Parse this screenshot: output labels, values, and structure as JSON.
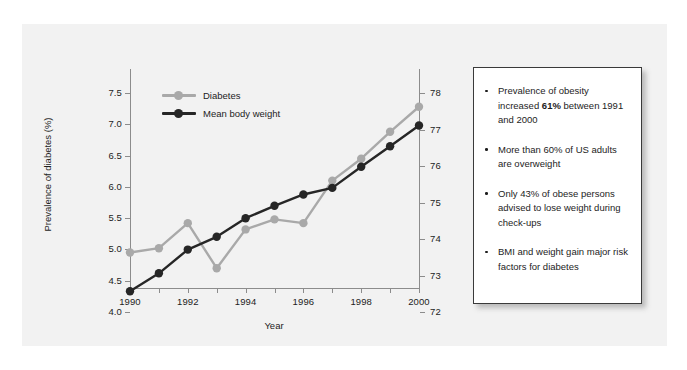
{
  "chart_data": {
    "type": "line",
    "title": "",
    "xlabel": "Year",
    "ylabel": "Prevalence of diabetes (%)",
    "y2label": "Mean body weight (kg)",
    "grid": false,
    "legend_position": "top-left inside plot",
    "x": [
      1990,
      1991,
      1992,
      1993,
      1994,
      1995,
      1996,
      1997,
      1998,
      1999,
      2000
    ],
    "xlim": [
      1990,
      2000
    ],
    "xticklabels": [
      "1990",
      "1992",
      "1994",
      "1996",
      "1998",
      "2000"
    ],
    "ylim": [
      4.0,
      7.5
    ],
    "yticklabels": [
      "4.0",
      "4.5",
      "5.0",
      "5.5",
      "6.0",
      "6.5",
      "7.0",
      "7.5"
    ],
    "y2lim": [
      72,
      78
    ],
    "y2ticklabels": [
      "72",
      "73",
      "74",
      "75",
      "76",
      "77",
      "78"
    ],
    "series": [
      {
        "name": "Diabetes",
        "axis": "left",
        "units": "%",
        "color": "#a9a9a9",
        "values": [
          4.95,
          5.02,
          5.42,
          4.7,
          5.32,
          5.48,
          5.42,
          6.1,
          6.45,
          6.88,
          7.28
        ]
      },
      {
        "name": "Mean body weight",
        "axis": "right",
        "units": "kg",
        "color": "#262626",
        "values": [
          72.57,
          73.06,
          73.71,
          74.06,
          74.57,
          74.91,
          75.22,
          75.4,
          75.98,
          76.54,
          77.11
        ]
      }
    ]
  },
  "legend": {
    "items": [
      {
        "label": "Diabetes",
        "color": "#a9a9a9"
      },
      {
        "label": "Mean body weight",
        "color": "#262626"
      }
    ]
  },
  "callout": {
    "bullets": [
      {
        "parts": [
          {
            "text": "Prevalence of obesity increased ",
            "bold": false
          },
          {
            "text": "61%",
            "bold": true
          },
          {
            "text": " between 1991 and 2000",
            "bold": false
          }
        ]
      },
      {
        "parts": [
          {
            "text": "More than 60% of US adults are overweight",
            "bold": false
          }
        ]
      },
      {
        "parts": [
          {
            "text": "Only 43% of obese persons advised to lose weight during check-ups",
            "bold": false
          }
        ]
      },
      {
        "parts": [
          {
            "text": "BMI and weight gain major risk factors for diabetes",
            "bold": false
          }
        ]
      }
    ]
  },
  "colors": {
    "panel_background": "#f2f2f2",
    "axis": "#8c8c8c",
    "text": "#1d1d1d",
    "callout_background": "#ffffff",
    "callout_border": "#3a3a3a"
  }
}
